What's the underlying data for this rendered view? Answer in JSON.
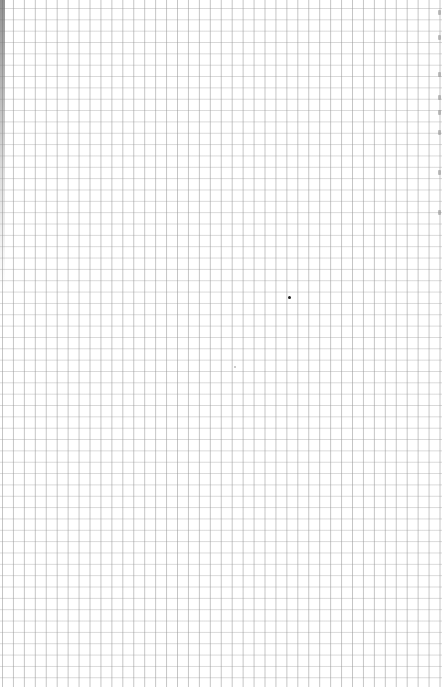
{
  "page": {
    "type": "graph-paper",
    "background_color": "#ffffff",
    "grid": {
      "line_color_vertical": "#969696",
      "line_color_horizontal": "#aaaaaa",
      "cell_width_px": 10.95,
      "cell_height_px": 11.35,
      "columns_visible": 40,
      "rows_visible": 60
    },
    "marks": {
      "center_dot": {
        "x": 289,
        "y": 297,
        "color": "#222222"
      },
      "faint_dot": {
        "x": 234,
        "y": 366
      },
      "right_edge_marks_y": [
        10,
        35,
        72,
        95,
        110,
        130,
        170,
        210
      ]
    }
  }
}
